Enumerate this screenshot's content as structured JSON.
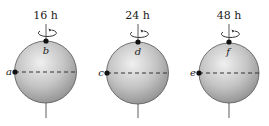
{
  "diagram": {
    "spheres": [
      {
        "period_label": "16 h",
        "pole_point": "b",
        "equator_point": "a",
        "cx": 45.5,
        "cy": 72
      },
      {
        "period_label": "24 h",
        "pole_point": "d",
        "equator_point": "c",
        "cx": 137.5,
        "cy": 73
      },
      {
        "period_label": "48 h",
        "pole_point": "f",
        "equator_point": "e",
        "cx": 229,
        "cy": 73
      }
    ],
    "colors": {
      "sphere_light": "#f2f2f2",
      "sphere_dark": "#8c8c8c",
      "line": "#333333",
      "point": "#111111"
    }
  }
}
